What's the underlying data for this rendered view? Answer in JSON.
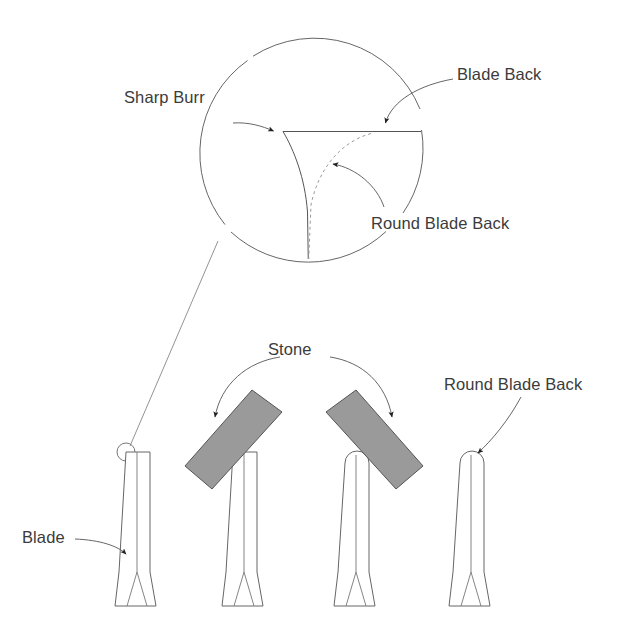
{
  "diagram": {
    "background_color": "#ffffff",
    "line_color": "#555555",
    "stone_fill_color": "#9a9a9a",
    "stone_stroke_color": "#555555",
    "dashed_curve_color": "#9a9a9a",
    "text_color": "#3b3b3b"
  },
  "labels": {
    "sharp_burr": "Sharp Burr",
    "blade_back": "Blade Back",
    "round_blade_back_detail": "Round Blade Back",
    "stone": "Stone",
    "round_blade_back_blade": "Round Blade Back",
    "blade": "Blade"
  },
  "detail_view": {
    "name": "magnified-blade-corner-detail",
    "description": "Magnified circular view of the blade back corner",
    "callouts": [
      {
        "label": "Sharp Burr",
        "points_to": "sharp-corner-junction"
      },
      {
        "label": "Blade Back",
        "points_to": "horizontal-back-surface"
      },
      {
        "label": "Round Blade Back",
        "points_to": "dashed-rounded-profile"
      }
    ]
  },
  "blades": [
    {
      "id": "blade-1",
      "name": "blade-sharp-back",
      "top_profile": "square",
      "stone_present": false,
      "label": "Blade",
      "marker": "detail-zoom-marker"
    },
    {
      "id": "blade-2",
      "name": "blade-with-stone-left-pass",
      "top_profile": "square",
      "stone_present": true,
      "stone_tilt_deg": -35
    },
    {
      "id": "blade-3",
      "name": "blade-with-stone-right-pass",
      "top_profile": "rounded",
      "stone_present": true,
      "stone_tilt_deg": 35
    },
    {
      "id": "blade-4",
      "name": "blade-round-back-finished",
      "top_profile": "rounded",
      "stone_present": false,
      "label": "Round Blade Back"
    }
  ]
}
